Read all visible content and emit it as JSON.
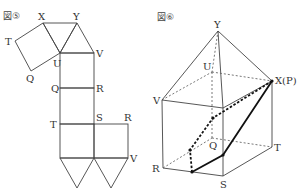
{
  "figures": [
    {
      "title": "図⑤",
      "description": "net of a solid: square prism with square pyramid top",
      "labels": {
        "X": "X",
        "Y": "Y",
        "T_top": "T",
        "Q_top": "Q",
        "U": "U",
        "V_top": "V",
        "Q_mid": "Q",
        "R_mid": "R",
        "T_low": "T",
        "S": "S",
        "R_low": "R",
        "V_low": "V"
      }
    },
    {
      "title": "図⑥",
      "description": "square prism with pyramid top, cross-section path",
      "labels": {
        "Y": "Y",
        "U": "U",
        "XP": "X(P)",
        "V": "V",
        "Q": "Q",
        "T": "T",
        "R": "R",
        "S": "S"
      }
    }
  ]
}
